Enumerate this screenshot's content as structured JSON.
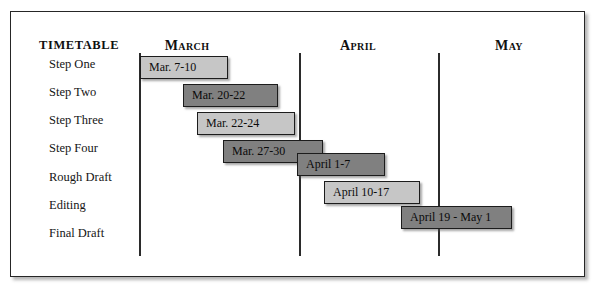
{
  "header": {
    "title": "TIMETABLE",
    "months": [
      {
        "label": "March",
        "x": 186
      },
      {
        "label": "April",
        "x": 357
      },
      {
        "label": "May",
        "x": 508
      }
    ]
  },
  "dividers": [
    138,
    298,
    437
  ],
  "rows": [
    {
      "label": "Step One",
      "y": 65
    },
    {
      "label": "Step Two",
      "y": 93
    },
    {
      "label": "Step Three",
      "y": 121
    },
    {
      "label": "Step Four",
      "y": 149
    },
    {
      "label": "Rough Draft",
      "y": 178
    },
    {
      "label": "Editing",
      "y": 206
    },
    {
      "label": "Final Draft",
      "y": 234
    }
  ],
  "bars": [
    {
      "label": "Mar. 7-10",
      "x": 139,
      "y": 55,
      "width": 88,
      "shade": "light"
    },
    {
      "label": "Mar. 20-22",
      "x": 182,
      "y": 83,
      "width": 95,
      "shade": "dark"
    },
    {
      "label": "Mar. 22-24",
      "x": 196,
      "y": 111,
      "width": 98,
      "shade": "light"
    },
    {
      "label": "Mar. 27-30",
      "x": 222,
      "y": 139,
      "width": 100,
      "shade": "dark"
    },
    {
      "label": "April 1-7",
      "x": 296,
      "y": 152,
      "width": 88,
      "shade": "dark"
    },
    {
      "label": "April 10-17",
      "x": 323,
      "y": 180,
      "width": 96,
      "shade": "light"
    },
    {
      "label": "April 19 - May 1",
      "x": 400,
      "y": 205,
      "width": 111,
      "shade": "dark"
    }
  ],
  "colors": {
    "light_bar": "#c6c6c6",
    "dark_bar": "#808080",
    "border": "#1c1c1c",
    "divider": "#2b2b2b",
    "background": "#ffffff"
  },
  "chart_data": {
    "type": "bar",
    "title": "TIMETABLE",
    "xlabel": "",
    "ylabel": "",
    "categories": [
      "Step One",
      "Step Two",
      "Step Three",
      "Step Four",
      "Rough Draft",
      "Editing",
      "Final Draft"
    ],
    "series": [
      {
        "name": "Schedule",
        "values": [
          {
            "task": "Step One",
            "range": "Mar. 7-10",
            "start": "March 7",
            "end": "March 10"
          },
          {
            "task": "Step Two",
            "range": "Mar. 20-22",
            "start": "March 20",
            "end": "March 22"
          },
          {
            "task": "Step Three",
            "range": "Mar. 22-24",
            "start": "March 22",
            "end": "March 24"
          },
          {
            "task": "Step Four",
            "range": "Mar. 27-30",
            "start": "March 27",
            "end": "March 30"
          },
          {
            "task": "Rough Draft",
            "range": "April 1-7",
            "start": "April 1",
            "end": "April 7"
          },
          {
            "task": "Editing",
            "range": "April 10-17",
            "start": "April 10",
            "end": "April 17"
          },
          {
            "task": "Final Draft",
            "range": "April 19 - May 1",
            "start": "April 19",
            "end": "May 1"
          }
        ]
      }
    ],
    "axis_tick_labels": [
      "March",
      "April",
      "May"
    ],
    "grid": false,
    "legend": "none"
  }
}
